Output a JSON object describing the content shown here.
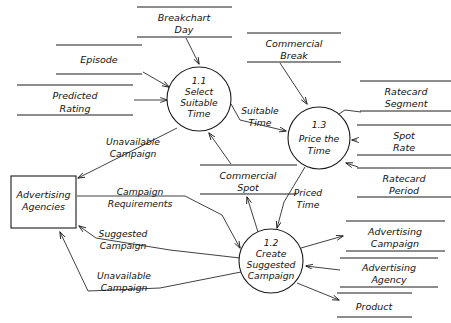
{
  "diagram": {
    "type": "data-flow-diagram",
    "stroke_color": "#1a1a1a",
    "background_color": "#ffffff"
  },
  "processes": [
    {
      "id": "1.1",
      "number": "1.1",
      "line1": "Select",
      "line2": "Suitable",
      "line3": "Time",
      "cx": 199,
      "cy": 99,
      "r": 32
    },
    {
      "id": "1.3",
      "number": "1.3",
      "line1": "Price the",
      "line2": "Time",
      "line3": "",
      "cx": 319,
      "cy": 138,
      "r": 31
    },
    {
      "id": "1.2",
      "number": "1.2",
      "line1": "Create",
      "line2": "Suggested",
      "line3": "Campaign",
      "cx": 271,
      "cy": 261,
      "r": 32
    }
  ],
  "entities": [
    {
      "id": "advertising-agencies",
      "line1": "Advertising",
      "line2": "Agencies",
      "x": 11,
      "y": 176,
      "w": 65,
      "h": 52
    }
  ],
  "datastores": [
    {
      "id": "breakchart-day",
      "line1": "Breakchart",
      "line2": "Day",
      "x1": 137,
      "x2": 232,
      "ytop": 7,
      "ybot": 37,
      "tx": 184
    },
    {
      "id": "episode",
      "line1": "Episode",
      "line2": "",
      "x1": 56,
      "x2": 142,
      "ytop": 45,
      "ybot": 74,
      "tx": 99
    },
    {
      "id": "commercial-break",
      "line1": "Commercial",
      "line2": "Break",
      "x1": 247,
      "x2": 341,
      "ytop": 33,
      "ybot": 62,
      "tx": 294
    },
    {
      "id": "predicted-rating",
      "line1": "Predicted",
      "line2": "Rating",
      "x1": 17,
      "x2": 133,
      "ytop": 85,
      "ybot": 115,
      "tx": 75
    },
    {
      "id": "ratecard-segment",
      "line1": "Ratecard",
      "line2": "Segment",
      "x1": 360,
      "x2": 451,
      "ytop": 81,
      "ybot": 111,
      "tx": 406
    },
    {
      "id": "spot-rate",
      "line1": "Spot",
      "line2": "Rate",
      "x1": 357,
      "x2": 451,
      "ytop": 125,
      "ybot": 155,
      "tx": 404
    },
    {
      "id": "ratecard-period",
      "line1": "Ratecard",
      "line2": "Period",
      "x1": 357,
      "x2": 451,
      "ytop": 168,
      "ybot": 197,
      "tx": 404
    },
    {
      "id": "commercial-spot",
      "line1": "Commercial",
      "line2": "Spot",
      "x1": 200,
      "x2": 297,
      "ytop": 165,
      "ybot": 194,
      "tx": 248
    },
    {
      "id": "advertising-campaign",
      "line1": "Advertising",
      "line2": "Campaign",
      "x1": 346,
      "x2": 445,
      "ytop": 221,
      "ybot": 251,
      "tx": 395
    },
    {
      "id": "advertising-agency",
      "line1": "Advertising",
      "line2": "Agency",
      "x1": 340,
      "x2": 438,
      "ytop": 258,
      "ybot": 287,
      "tx": 389
    },
    {
      "id": "product",
      "line1": "Product",
      "line2": "",
      "x1": 337,
      "x2": 412,
      "ytop": 293,
      "ybot": 317,
      "tx": 374
    }
  ],
  "flow_labels": [
    {
      "id": "suitable-time",
      "line1": "Suitable",
      "line2": "Time",
      "tx": 260,
      "ty": 114
    },
    {
      "id": "unavailable-campaign-1",
      "line1": "Unavailable",
      "line2": "Campaign",
      "tx": 133,
      "ty": 145
    },
    {
      "id": "campaign-requirements",
      "line1": "Campaign",
      "line2": "Requirements",
      "tx": 140,
      "ty": 195
    },
    {
      "id": "suggested-campaign",
      "line1": "Suggested",
      "line2": "Campaign",
      "tx": 123,
      "ty": 237
    },
    {
      "id": "unavailable-campaign-2",
      "line1": "Unavailable",
      "line2": "Campaign",
      "tx": 124,
      "ty": 279
    },
    {
      "id": "priced-time",
      "line1": "Priced",
      "line2": "Time",
      "tx": 308,
      "ty": 196
    }
  ]
}
